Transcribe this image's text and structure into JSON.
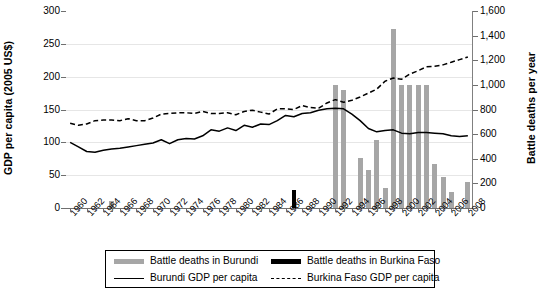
{
  "chart_data": {
    "type": "bar",
    "title": "",
    "xlabel": "",
    "ylabel": "GDP per capita (2005 US$)",
    "ylabel_right": "Battle deaths per year",
    "ylim": [
      0,
      300
    ],
    "yticks": [
      "0",
      "50",
      "100",
      "150",
      "200",
      "250",
      "300"
    ],
    "ylim_right": [
      0,
      1600
    ],
    "yticks_right": [
      "0",
      "200",
      "400",
      "600",
      "800",
      "1,000",
      "1,200",
      "1,400",
      "1,600"
    ],
    "grid": true,
    "legend_position": "bottom",
    "x": [
      1960,
      1961,
      1962,
      1963,
      1964,
      1965,
      1966,
      1967,
      1968,
      1969,
      1970,
      1971,
      1972,
      1973,
      1974,
      1975,
      1976,
      1977,
      1978,
      1979,
      1980,
      1981,
      1982,
      1983,
      1984,
      1985,
      1986,
      1987,
      1988,
      1989,
      1990,
      1991,
      1992,
      1993,
      1994,
      1995,
      1996,
      1997,
      1998,
      1999,
      2000,
      2001,
      2002,
      2003,
      2004,
      2005,
      2006,
      2007,
      2008
    ],
    "xtick_labels": [
      "1960",
      "1962",
      "1964",
      "1966",
      "1968",
      "1970",
      "1972",
      "1974",
      "1976",
      "1978",
      "1980",
      "1982",
      "1984",
      "1986",
      "1988",
      "1990",
      "1992",
      "1994",
      "1996",
      "1998",
      "2000",
      "2002",
      "2004",
      "2006",
      "2008"
    ],
    "series": [
      {
        "name": "Battle deaths in Burundi",
        "type": "bar",
        "axis": "right",
        "color": "#a6a6a6",
        "values": [
          0,
          0,
          0,
          0,
          0,
          55,
          0,
          0,
          0,
          0,
          0,
          0,
          0,
          0,
          0,
          0,
          0,
          0,
          0,
          0,
          0,
          0,
          0,
          0,
          0,
          0,
          0,
          0,
          0,
          0,
          0,
          0,
          1000,
          960,
          0,
          410,
          310,
          550,
          160,
          1450,
          1000,
          1000,
          1000,
          1000,
          360,
          250,
          130,
          0,
          210
        ]
      },
      {
        "name": "Battle deaths in Burkina Faso",
        "type": "bar",
        "axis": "right",
        "color": "#000000",
        "values": [
          0,
          0,
          0,
          0,
          0,
          0,
          0,
          0,
          0,
          0,
          0,
          0,
          0,
          0,
          0,
          0,
          0,
          0,
          0,
          0,
          0,
          0,
          0,
          0,
          0,
          0,
          0,
          150,
          0,
          0,
          0,
          0,
          0,
          0,
          0,
          0,
          0,
          0,
          0,
          0,
          0,
          0,
          0,
          0,
          0,
          0,
          0,
          0,
          0
        ]
      },
      {
        "name": "Burundi GDP per capita",
        "type": "line",
        "style": "solid",
        "axis": "left",
        "color": "#000000",
        "values": [
          100,
          93,
          86,
          85,
          88,
          90,
          91,
          93,
          95,
          97,
          99,
          104,
          98,
          104,
          106,
          105,
          110,
          119,
          117,
          122,
          118,
          126,
          123,
          128,
          127,
          133,
          141,
          139,
          144,
          145,
          149,
          151,
          152,
          151,
          143,
          133,
          121,
          116,
          118,
          119,
          114,
          113,
          115,
          115,
          114,
          113,
          110,
          109,
          110
        ]
      },
      {
        "name": "Burkina Faso GDP per capita",
        "type": "line",
        "style": "dashed",
        "axis": "left",
        "color": "#000000",
        "values": [
          129,
          126,
          128,
          133,
          134,
          134,
          133,
          136,
          133,
          133,
          137,
          143,
          144,
          145,
          145,
          144,
          147,
          144,
          144,
          145,
          142,
          147,
          149,
          146,
          143,
          151,
          151,
          150,
          156,
          153,
          152,
          160,
          165,
          161,
          164,
          169,
          175,
          181,
          193,
          198,
          196,
          204,
          209,
          215,
          216,
          218,
          222,
          226,
          230
        ]
      }
    ]
  },
  "legend": {
    "items": [
      {
        "label": "Battle deaths in Burundi",
        "swatch": "grey-bar"
      },
      {
        "label": "Battle deaths in Burkina Faso",
        "swatch": "black-bar"
      },
      {
        "label": "Burundi GDP per capita",
        "swatch": "solid-line"
      },
      {
        "label": "Burkina Faso GDP per capita",
        "swatch": "dashed-line"
      }
    ]
  }
}
